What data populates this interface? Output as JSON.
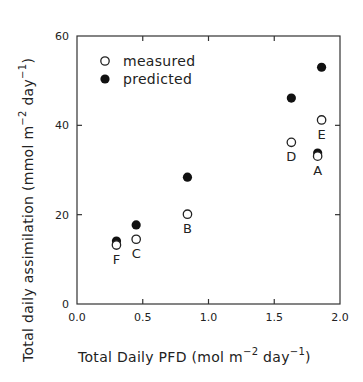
{
  "chart_data": {
    "type": "scatter",
    "title": "",
    "xlabel": {
      "text": "Total Daily PFD (mol m",
      "sup1": "−2",
      "mid": " day",
      "sup2": "−1",
      "end": ")"
    },
    "ylabel": {
      "text": "Total daily assimilation (mmol m",
      "sup1": "−2",
      "mid": " day",
      "sup2": "−1",
      "end": ")"
    },
    "xlim": [
      0.0,
      2.0
    ],
    "ylim": [
      0,
      60
    ],
    "xticks": [
      0.0,
      0.5,
      1.0,
      1.5,
      2.0
    ],
    "xtick_labels": [
      "0.0",
      "0.5",
      "1.0",
      "1.5",
      "2.0"
    ],
    "yticks": [
      0,
      20,
      40,
      60
    ],
    "ytick_labels": [
      "0",
      "20",
      "40",
      "60"
    ],
    "grid": false,
    "legend": {
      "placement": "top-left",
      "entries": [
        {
          "label": "measured",
          "marker": "open-circle"
        },
        {
          "label": "predicted",
          "marker": "filled-circle"
        }
      ]
    },
    "series": [
      {
        "name": "measured",
        "marker": "open-circle",
        "points": [
          {
            "label": "A",
            "x": 1.83,
            "y": 33.1
          },
          {
            "label": "B",
            "x": 0.84,
            "y": 20.1
          },
          {
            "label": "C",
            "x": 0.45,
            "y": 14.5
          },
          {
            "label": "D",
            "x": 1.63,
            "y": 36.2
          },
          {
            "label": "E",
            "x": 1.86,
            "y": 41.2
          },
          {
            "label": "F",
            "x": 0.3,
            "y": 13.2
          }
        ]
      },
      {
        "name": "predicted",
        "marker": "filled-circle",
        "points": [
          {
            "label": "A",
            "x": 1.83,
            "y": 33.8
          },
          {
            "label": "B",
            "x": 0.84,
            "y": 28.4
          },
          {
            "label": "C",
            "x": 0.45,
            "y": 17.7
          },
          {
            "label": "D",
            "x": 1.63,
            "y": 46.1
          },
          {
            "label": "E",
            "x": 1.86,
            "y": 53.0
          },
          {
            "label": "F",
            "x": 0.3,
            "y": 14.1
          }
        ]
      }
    ],
    "point_labels": [
      {
        "text": "A",
        "x": 1.83,
        "y": 33.1,
        "position": "below"
      },
      {
        "text": "B",
        "x": 0.84,
        "y": 20.1,
        "position": "below"
      },
      {
        "text": "C",
        "x": 0.45,
        "y": 14.5,
        "position": "below"
      },
      {
        "text": "D",
        "x": 1.63,
        "y": 36.2,
        "position": "below"
      },
      {
        "text": "E",
        "x": 1.86,
        "y": 41.2,
        "position": "below"
      },
      {
        "text": "F",
        "x": 0.3,
        "y": 13.2,
        "position": "below"
      }
    ]
  }
}
